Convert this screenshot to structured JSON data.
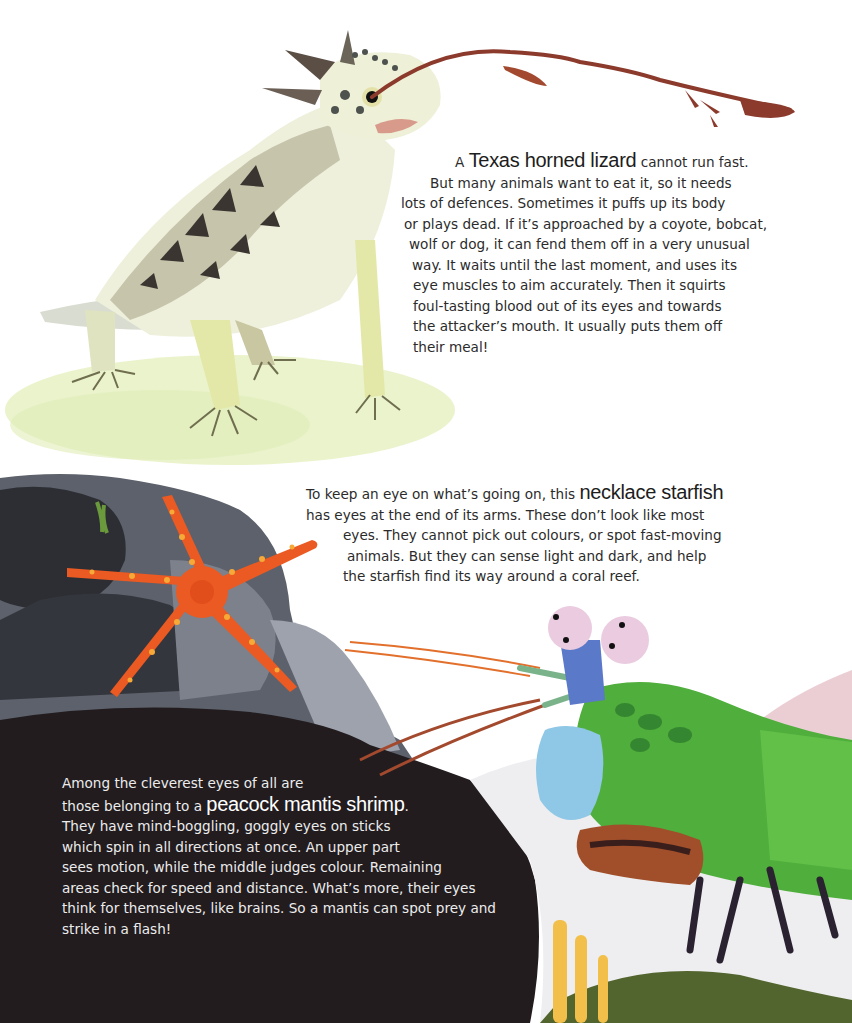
{
  "page": {
    "background": "#ffffff",
    "colors": {
      "body_text": "#2b2b2b",
      "dark_panel": "#221c1f",
      "starfish_orange": "#ea5a22",
      "starfish_dots": "#f6a936",
      "lizard_blood": "#8b3a2c",
      "shrimp_green": "#4fae3c",
      "shrimp_eye_pink": "#eacbe0",
      "shrimp_blue": "#5b79c9",
      "lizard_ground": "#e6f0c4",
      "rock_grey": "#6f7480"
    }
  },
  "sections": {
    "lizard": {
      "highlight": "Texas horned lizard",
      "lines": [
        {
          "pre": "A ",
          "highlight": "Texas horned lizard",
          "post": " cannot run fast."
        },
        {
          "text": "But many animals want to eat it, so it needs"
        },
        {
          "text": "lots of defences. Sometimes it puffs up its body"
        },
        {
          "text": "or plays dead. If it’s approached by a coyote, bobcat,"
        },
        {
          "text": "wolf or dog, it can fend them off in a very unusual"
        },
        {
          "text": "way. It waits until the last moment, and uses its"
        },
        {
          "text": "eye muscles to aim accurately. Then it squirts"
        },
        {
          "text": "foul-tasting blood out of its eyes and towards"
        },
        {
          "text": "the attacker’s mouth. It usually puts them off"
        },
        {
          "text": "their meal!"
        }
      ]
    },
    "starfish": {
      "highlight": "necklace starfish",
      "lines": [
        {
          "pre": "To keep an eye on what’s going on, this ",
          "highlight": "necklace starfish",
          "post": ""
        },
        {
          "text": "has eyes at the end of its arms. These don’t look like most"
        },
        {
          "text": "eyes. They cannot pick out colours, or spot fast-moving"
        },
        {
          "text": "animals. But they can sense light and dark, and help"
        },
        {
          "text": "the starfish find its way around a coral reef."
        }
      ]
    },
    "shrimp": {
      "highlight": "peacock mantis shrimp",
      "lines": [
        {
          "text": "Among the cleverest eyes of all are"
        },
        {
          "pre": "those belonging to a ",
          "highlight": "peacock mantis shrimp",
          "post": "."
        },
        {
          "text": "They have mind-boggling, goggly eyes on sticks"
        },
        {
          "text": "which spin in all directions at once. An upper part"
        },
        {
          "text": "sees motion, while the middle judges colour. Remaining"
        },
        {
          "text": "areas check for speed and distance. What’s more, their eyes"
        },
        {
          "text": "think for themselves, like brains. So a mantis can spot prey and"
        },
        {
          "text": "strike in a flash!"
        }
      ]
    }
  },
  "illustrations": [
    {
      "name": "texas-horned-lizard",
      "description": "Horned lizard squirting blood from its eye"
    },
    {
      "name": "necklace-starfish",
      "description": "Orange spotted starfish on dark rocks"
    },
    {
      "name": "peacock-mantis-shrimp",
      "description": "Green mantis shrimp with pink stalked eyes"
    }
  ]
}
